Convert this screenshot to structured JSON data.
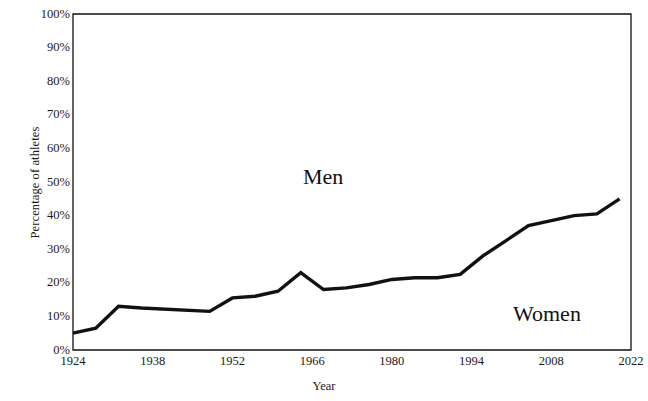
{
  "chart_data": {
    "type": "line",
    "title": "",
    "xlabel": "Year",
    "ylabel": "Percentage of athletes",
    "xlim": [
      1924,
      2022
    ],
    "ylim": [
      0,
      100
    ],
    "grid": false,
    "legend_position": "inline-annotation",
    "x_tick_labels": [
      "1924",
      "1938",
      "1952",
      "1966",
      "1980",
      "1994",
      "2008",
      "2022"
    ],
    "x_tick_values": [
      1924,
      1938,
      1952,
      1966,
      1980,
      1994,
      2008,
      2022
    ],
    "y_tick_labels": [
      "0%",
      "10%",
      "20%",
      "30%",
      "40%",
      "50%",
      "60%",
      "70%",
      "80%",
      "90%",
      "100%"
    ],
    "y_tick_values": [
      0,
      10,
      20,
      30,
      40,
      50,
      60,
      70,
      80,
      90,
      100
    ],
    "annotations": [
      {
        "text": "Men",
        "x": 1965,
        "y": 52
      },
      {
        "text": "Women",
        "x": 2008,
        "y": 14
      }
    ],
    "series": [
      {
        "name": "Women",
        "color": "#111111",
        "x": [
          1924,
          1928,
          1932,
          1936,
          1948,
          1952,
          1956,
          1960,
          1964,
          1968,
          1972,
          1976,
          1980,
          1984,
          1988,
          1992,
          1996,
          2000,
          2004,
          2008,
          2012,
          2016,
          2020
        ],
        "values": [
          5.0,
          6.5,
          13.0,
          12.5,
          11.5,
          15.5,
          16.0,
          17.5,
          23.0,
          18.0,
          18.5,
          19.5,
          21.0,
          21.5,
          21.5,
          22.5,
          28.0,
          32.5,
          37.0,
          38.5,
          40.0,
          40.5,
          45.0
        ]
      }
    ]
  },
  "axes": {
    "y_title": "Percentage of athletes",
    "x_title": "Year"
  }
}
